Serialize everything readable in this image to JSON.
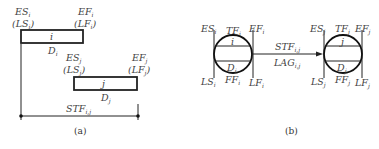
{
  "panel_a": {
    "caption": "(a)",
    "activity_i": {
      "name": "i",
      "duration": "D",
      "duration_sub": "i",
      "start_label": "ES",
      "start_sub": "i",
      "start_alt": "(LS",
      "start_alt_sub": "i",
      "finish_label": "EF",
      "finish_sub": "i",
      "finish_alt": "(LF",
      "finish_alt_sub": "i"
    },
    "activity_j": {
      "name": "j",
      "duration": "D",
      "duration_sub": "j",
      "start_label": "ES",
      "start_sub": "j",
      "start_alt": "(LS",
      "start_alt_sub": "j",
      "finish_label": "EF",
      "finish_sub": "j",
      "finish_alt": "(LF",
      "finish_alt_sub": "j"
    },
    "relation": {
      "label": "STF",
      "sub": "i,j"
    }
  },
  "panel_b": {
    "caption": "(b)",
    "node_i": {
      "name": "i",
      "ES": "ES",
      "ES_sub": "i",
      "TF": "TF",
      "TF_sub": "i",
      "EF": "EF",
      "EF_sub": "i",
      "LS": "LS",
      "LS_sub": "i",
      "FF": "FF",
      "FF_sub": "i",
      "LF": "LF",
      "LF_sub": "i",
      "D": "D",
      "D_sub": "i"
    },
    "node_j": {
      "name": "j",
      "ES": "ES",
      "ES_sub": "j",
      "TF": "TF",
      "TF_sub": "j",
      "EF": "EF",
      "EF_sub": "j",
      "LS": "LS",
      "LS_sub": "j",
      "FF": "FF",
      "FF_sub": "j",
      "LF": "LF",
      "LF_sub": "j",
      "D": "D",
      "D_sub": "j"
    },
    "arrow": {
      "top_label": "STF",
      "top_sub": "i,j",
      "bottom_label": "LAG",
      "bottom_sub": "i,j"
    }
  }
}
